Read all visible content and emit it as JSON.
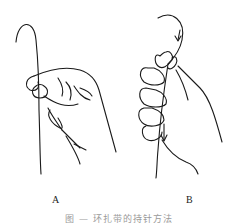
{
  "figure": {
    "panels": [
      {
        "id": "A",
        "label": "A",
        "description": "Hand holding curved suture needle between thumb and index finger, thread hanging down"
      },
      {
        "id": "B",
        "label": "B",
        "description": "Hand holding curved needle with fingers wrapped, arrow indicating downward thread direction"
      }
    ],
    "caption": "图 — 环扎带的持针方法",
    "colors": {
      "line": "#1a1a1a",
      "background": "#ffffff",
      "caption": "#9a9a9a"
    }
  }
}
